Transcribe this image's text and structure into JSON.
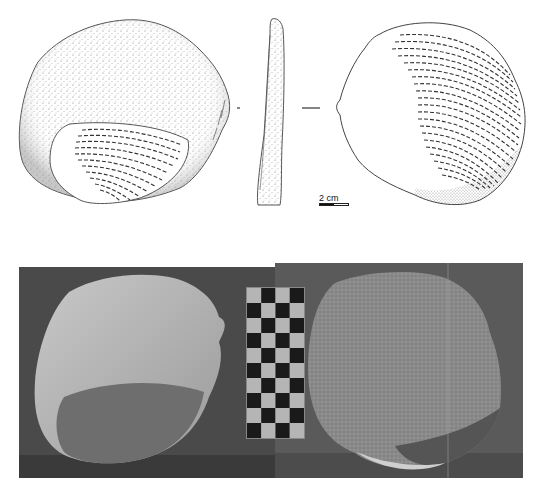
{
  "figure": {
    "drawings": {
      "views": [
        {
          "name": "dorsal-face",
          "style": "stippled cortex with hatched flake scar at lower left"
        },
        {
          "name": "profile",
          "style": "narrow side view with stippling"
        },
        {
          "name": "ventral-face",
          "style": "concentric hatched ripple lines with stippled lower edge"
        }
      ],
      "scale": {
        "label": "2 cm"
      }
    },
    "photos": {
      "views": [
        {
          "name": "photo-dorsal-face"
        },
        {
          "name": "photo-ventral-face"
        }
      ],
      "scale_bar": {
        "type": "checkerboard",
        "columns": 4,
        "rows": 10
      }
    },
    "colors": {
      "background": "#ffffff",
      "line": "#444444",
      "photo_bg_left": "#4a4a4a",
      "photo_bg_right": "#5a5a5a",
      "stone_light": "#b8b8b8",
      "stone_mid": "#8a8a8a"
    }
  }
}
